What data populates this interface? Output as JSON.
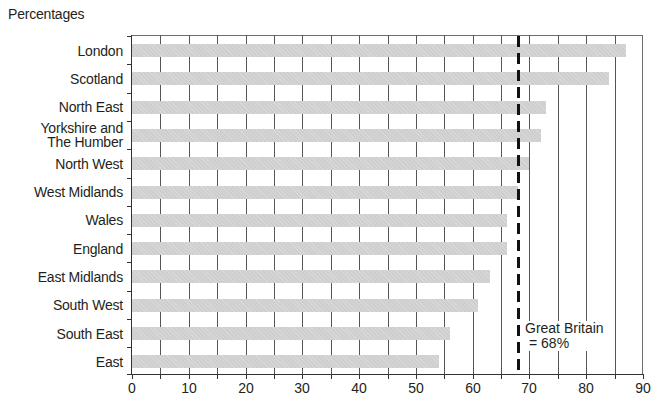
{
  "chart_data": {
    "type": "bar",
    "orientation": "horizontal",
    "title": "",
    "unit_label": "Percentages",
    "xlabel": "",
    "ylabel": "",
    "xlim": [
      0,
      90
    ],
    "x_ticks": [
      0,
      10,
      20,
      30,
      40,
      50,
      60,
      70,
      80,
      90
    ],
    "minor_gridline_step": 5,
    "grid": true,
    "categories": [
      "London",
      "Scotland",
      "North East",
      "Yorkshire and The Humber",
      "North West",
      "West Midlands",
      "Wales",
      "England",
      "East Midlands",
      "South West",
      "South East",
      "East"
    ],
    "category_display": [
      "London",
      "Scotland",
      "North East",
      "Yorkshire and\nThe Humber",
      "North West",
      "West Midlands",
      "Wales",
      "England",
      "East Midlands",
      "South West",
      "South East",
      "East"
    ],
    "values": [
      87,
      84,
      73,
      72,
      70,
      68,
      66,
      66,
      63,
      61,
      56,
      54
    ],
    "reference_line": {
      "value": 68,
      "style": "dashed",
      "label_line1": "Great Britain",
      "label_line2": "= 68%"
    },
    "colors": {
      "bar": "#cfcfcf",
      "reference": "#111111",
      "grid": "#555555"
    }
  },
  "labels": {
    "unit": "Percentages",
    "ref1": "Great Britain",
    "ref2": "= 68%"
  }
}
